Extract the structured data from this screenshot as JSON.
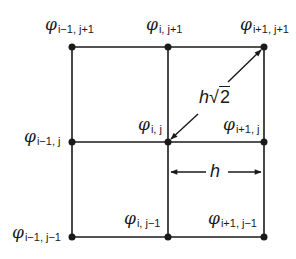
{
  "diagram": {
    "type": "finite-difference grid stencil",
    "symbol": "φ",
    "grid": {
      "columns": 3,
      "rows": 3,
      "line_color": "#1a1a1a"
    },
    "nodes": [
      {
        "id": "tl",
        "sub": "i−1, j+1"
      },
      {
        "id": "tm",
        "sub": "i, j+1"
      },
      {
        "id": "tr",
        "sub": "i+1, j+1"
      },
      {
        "id": "ml",
        "sub": "i−1, j"
      },
      {
        "id": "mm",
        "sub": "i, j"
      },
      {
        "id": "mr",
        "sub": "i+1, j"
      },
      {
        "id": "bl",
        "sub": "i−1, j−1"
      },
      {
        "id": "bm",
        "sub": "i, j−1"
      },
      {
        "id": "br",
        "sub": "i+1, j−1"
      }
    ],
    "dimensions": {
      "horizontal_spacing": "h",
      "diagonal_spacing_prefix": "h",
      "diagonal_spacing_radicand": "2"
    }
  }
}
